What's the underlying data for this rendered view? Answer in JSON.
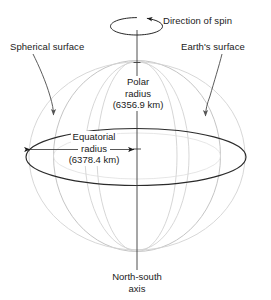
{
  "figure": {
    "background_color": "#ffffff",
    "ink_color": "#1a1a1a",
    "reference_sphere_color": "#b9b9b9",
    "earth_outline_color": "#2b2b2b"
  },
  "labels": {
    "direction_of_spin": "Direction of spin",
    "spherical_surface": "Spherical surface",
    "earths_surface": "Earth's surface",
    "polar_radius_line1": "Polar",
    "polar_radius_line2": "radius",
    "polar_radius_value": "(6356.9 km)",
    "equatorial_radius_line1": "Equatorial",
    "equatorial_radius_line2": "radius",
    "equatorial_radius_value": "(6378.4 km)",
    "axis_line1": "North-south",
    "axis_line2": "axis"
  },
  "measurements": {
    "polar_radius_km": 6356.9,
    "equatorial_radius_km": 6378.4,
    "polar_radius_units": "km",
    "equatorial_radius_units": "km"
  },
  "icons": {
    "spin_arrow": "spin-arrow-icon",
    "leader_left": "leader-arrow-icon",
    "leader_right": "leader-arrow-icon",
    "equatorial_dimension": "double-headed-arrow-icon",
    "axis": "axis-line-icon",
    "center_mark": "center-point-icon"
  }
}
